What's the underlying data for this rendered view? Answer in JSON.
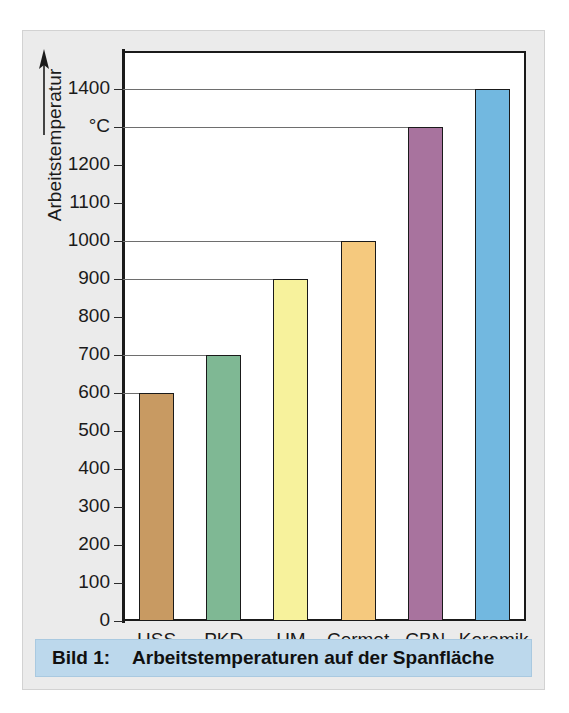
{
  "figure": {
    "caption_number": "Bild 1:",
    "caption_text": "Arbeitstemperaturen auf der Spanfläche",
    "panel_bg": "#ebebeb",
    "caption_bg": "#bcd8ec"
  },
  "chart_data": {
    "type": "bar",
    "title": "Arbeitstemperaturen auf der Spanfläche",
    "xlabel": "",
    "ylabel": "Arbeitstemperatur",
    "yunit": "°C",
    "ylim": [
      0,
      1500
    ],
    "grid": true,
    "grid_values": [
      600,
      700,
      900,
      1000,
      1300,
      1400
    ],
    "legend": "none",
    "categories": [
      "HSS",
      "PKD",
      "HM",
      "Cermet",
      "CBN",
      "Keramik"
    ],
    "values": [
      600,
      700,
      900,
      1000,
      1300,
      1400
    ],
    "colors": [
      "#c89a62",
      "#7fb894",
      "#f7f29c",
      "#f5c97e",
      "#a8739e",
      "#72b8e0"
    ],
    "yticks": [
      {
        "value": 1400,
        "label": "1400"
      },
      {
        "value": 1300,
        "label": "°C"
      },
      {
        "value": 1200,
        "label": "1200"
      },
      {
        "value": 1100,
        "label": "1100"
      },
      {
        "value": 1000,
        "label": "1000"
      },
      {
        "value": 900,
        "label": "900"
      },
      {
        "value": 800,
        "label": "800"
      },
      {
        "value": 700,
        "label": "700"
      },
      {
        "value": 600,
        "label": "600"
      },
      {
        "value": 500,
        "label": "500"
      },
      {
        "value": 400,
        "label": "400"
      },
      {
        "value": 300,
        "label": "300"
      },
      {
        "value": 200,
        "label": "200"
      },
      {
        "value": 100,
        "label": "100"
      },
      {
        "value": 0,
        "label": "0"
      }
    ]
  }
}
